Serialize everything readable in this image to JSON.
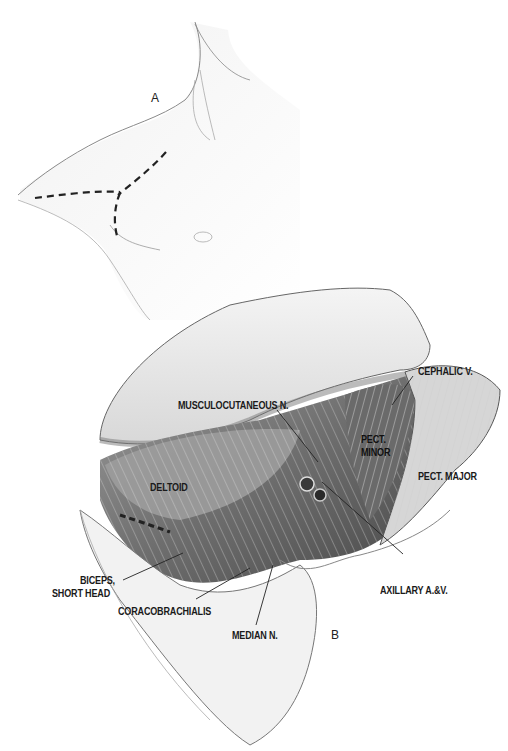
{
  "figure": {
    "panels": [
      {
        "id": "A",
        "label": "A",
        "description": "Incision lines on shoulder/chest (dashed)"
      },
      {
        "id": "B",
        "label": "B",
        "description": "Exposed deltopectoral region with retracted flap"
      }
    ],
    "labels": {
      "cephalic_v": "CEPHALIC V.",
      "musculocutaneous_n": "MUSCULOCUTANEOUS N.",
      "pect_minor_1": "PECT.",
      "pect_minor_2": "MINOR",
      "pect_major": "PECT. MAJOR",
      "deltoid": "DELTOID",
      "biceps_1": "BICEPS,",
      "biceps_2": "SHORT HEAD",
      "coracobrachialis": "CORACOBRACHIALIS",
      "median_n": "MEDIAN N.",
      "axillary": "AXILLARY A.&V."
    },
    "colors": {
      "ink": "#1a1a1a",
      "muscle_dark": "#5a5a5a",
      "muscle_mid": "#8a8a8a",
      "skin": "#e8e8e8",
      "flap": "#f2f2f2"
    }
  }
}
